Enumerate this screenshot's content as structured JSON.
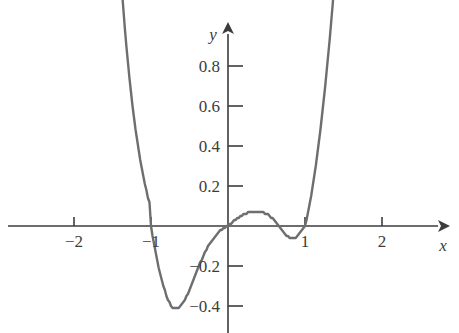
{
  "chart_data": {
    "type": "line",
    "title": "",
    "subtitle": "",
    "xlabel": "x",
    "ylabel": "y",
    "xlim": [
      -2.55,
      2.75
    ],
    "ylim": [
      -0.52,
      0.99
    ],
    "grid": false,
    "legend": null,
    "legend_position": "none",
    "x_ticks": [
      -2,
      -1,
      1,
      2
    ],
    "x_tick_labels": [
      "−2",
      "−1",
      "1",
      "2"
    ],
    "y_ticks": [
      0.8,
      0.6,
      0.4,
      0.2,
      -0.2,
      -0.4
    ],
    "y_tick_labels": [
      "0.8",
      "0.6",
      "0.4",
      "0.2",
      "−0.2",
      "−0.4"
    ],
    "series": [
      {
        "name": "curve",
        "color": "#6e6e6e",
        "line_width": 2.4,
        "roots": [
          -1,
          0,
          1
        ],
        "annotations": [
          {
            "kind": "local-minimum",
            "x": -0.68,
            "y": -0.41
          },
          {
            "kind": "root",
            "x": -1,
            "y": 0
          },
          {
            "kind": "root",
            "x": 0,
            "y": 0
          },
          {
            "kind": "local-maximum",
            "x": 0.45,
            "y": 0.07
          },
          {
            "kind": "local-minimum",
            "x": 0.85,
            "y": -0.06
          },
          {
            "kind": "root",
            "x": 1,
            "y": 0
          }
        ],
        "points": [
          [
            -1.4,
            1.3
          ],
          [
            -1.38,
            1.19
          ],
          [
            -1.36,
            1.09
          ],
          [
            -1.34,
            0.99
          ],
          [
            -1.32,
            0.9
          ],
          [
            -1.3,
            0.82
          ],
          [
            -1.28,
            0.74
          ],
          [
            -1.26,
            0.67
          ],
          [
            -1.24,
            0.6
          ],
          [
            -1.22,
            0.54
          ],
          [
            -1.2,
            0.48
          ],
          [
            -1.18,
            0.43
          ],
          [
            -1.16,
            0.38
          ],
          [
            -1.14,
            0.33
          ],
          [
            -1.12,
            0.29
          ],
          [
            -1.1,
            0.25
          ],
          [
            -1.08,
            0.21
          ],
          [
            -1.06,
            0.18
          ],
          [
            -1.04,
            0.14
          ],
          [
            -1.02,
            0.12
          ],
          [
            -1.0,
            0.0
          ],
          [
            -0.98,
            -0.05
          ],
          [
            -0.96,
            -0.09
          ],
          [
            -0.94,
            -0.13
          ],
          [
            -0.92,
            -0.17
          ],
          [
            -0.9,
            -0.21
          ],
          [
            -0.88,
            -0.24
          ],
          [
            -0.86,
            -0.27
          ],
          [
            -0.84,
            -0.3
          ],
          [
            -0.82,
            -0.32
          ],
          [
            -0.8,
            -0.35
          ],
          [
            -0.78,
            -0.37
          ],
          [
            -0.76,
            -0.38
          ],
          [
            -0.74,
            -0.4
          ],
          [
            -0.72,
            -0.41
          ],
          [
            -0.7,
            -0.41
          ],
          [
            -0.68,
            -0.41
          ],
          [
            -0.66,
            -0.41
          ],
          [
            -0.64,
            -0.41
          ],
          [
            -0.62,
            -0.4
          ],
          [
            -0.6,
            -0.39
          ],
          [
            -0.58,
            -0.38
          ],
          [
            -0.56,
            -0.37
          ],
          [
            -0.54,
            -0.35
          ],
          [
            -0.52,
            -0.34
          ],
          [
            -0.5,
            -0.32
          ],
          [
            -0.48,
            -0.3
          ],
          [
            -0.46,
            -0.28
          ],
          [
            -0.44,
            -0.26
          ],
          [
            -0.42,
            -0.24
          ],
          [
            -0.4,
            -0.22
          ],
          [
            -0.38,
            -0.2
          ],
          [
            -0.36,
            -0.18
          ],
          [
            -0.34,
            -0.17
          ],
          [
            -0.32,
            -0.15
          ],
          [
            -0.3,
            -0.13
          ],
          [
            -0.28,
            -0.12
          ],
          [
            -0.26,
            -0.1
          ],
          [
            -0.24,
            -0.09
          ],
          [
            -0.22,
            -0.08
          ],
          [
            -0.2,
            -0.07
          ],
          [
            -0.18,
            -0.06
          ],
          [
            -0.16,
            -0.05
          ],
          [
            -0.14,
            -0.04
          ],
          [
            -0.12,
            -0.03
          ],
          [
            -0.1,
            -0.02
          ],
          [
            -0.08,
            -0.02
          ],
          [
            -0.06,
            -0.01
          ],
          [
            -0.04,
            -0.01
          ],
          [
            -0.02,
            0.0
          ],
          [
            0.0,
            0.0
          ],
          [
            0.02,
            0.01
          ],
          [
            0.04,
            0.01
          ],
          [
            0.06,
            0.02
          ],
          [
            0.08,
            0.03
          ],
          [
            0.1,
            0.03
          ],
          [
            0.12,
            0.04
          ],
          [
            0.14,
            0.04
          ],
          [
            0.16,
            0.05
          ],
          [
            0.18,
            0.05
          ],
          [
            0.2,
            0.06
          ],
          [
            0.22,
            0.06
          ],
          [
            0.24,
            0.06
          ],
          [
            0.26,
            0.07
          ],
          [
            0.28,
            0.07
          ],
          [
            0.3,
            0.07
          ],
          [
            0.32,
            0.07
          ],
          [
            0.34,
            0.07
          ],
          [
            0.36,
            0.07
          ],
          [
            0.38,
            0.07
          ],
          [
            0.4,
            0.07
          ],
          [
            0.42,
            0.07
          ],
          [
            0.44,
            0.07
          ],
          [
            0.46,
            0.07
          ],
          [
            0.48,
            0.06
          ],
          [
            0.5,
            0.06
          ],
          [
            0.52,
            0.06
          ],
          [
            0.54,
            0.05
          ],
          [
            0.56,
            0.04
          ],
          [
            0.58,
            0.04
          ],
          [
            0.6,
            0.03
          ],
          [
            0.62,
            0.02
          ],
          [
            0.64,
            0.01
          ],
          [
            0.66,
            0.0
          ],
          [
            0.68,
            -0.01
          ],
          [
            0.7,
            -0.02
          ],
          [
            0.72,
            -0.03
          ],
          [
            0.74,
            -0.04
          ],
          [
            0.76,
            -0.05
          ],
          [
            0.78,
            -0.05
          ],
          [
            0.8,
            -0.06
          ],
          [
            0.82,
            -0.06
          ],
          [
            0.84,
            -0.06
          ],
          [
            0.86,
            -0.06
          ],
          [
            0.88,
            -0.06
          ],
          [
            0.9,
            -0.05
          ],
          [
            0.92,
            -0.04
          ],
          [
            0.94,
            -0.03
          ],
          [
            0.96,
            -0.02
          ],
          [
            0.98,
            -0.01
          ],
          [
            1.0,
            0.0
          ],
          [
            1.02,
            0.03
          ],
          [
            1.04,
            0.07
          ],
          [
            1.06,
            0.11
          ],
          [
            1.08,
            0.15
          ],
          [
            1.1,
            0.2
          ],
          [
            1.12,
            0.25
          ],
          [
            1.14,
            0.3
          ],
          [
            1.16,
            0.36
          ],
          [
            1.18,
            0.42
          ],
          [
            1.2,
            0.48
          ],
          [
            1.22,
            0.55
          ],
          [
            1.24,
            0.62
          ],
          [
            1.26,
            0.69
          ],
          [
            1.28,
            0.77
          ],
          [
            1.3,
            0.85
          ],
          [
            1.32,
            0.93
          ],
          [
            1.34,
            1.02
          ],
          [
            1.36,
            1.11
          ],
          [
            1.38,
            1.21
          ],
          [
            1.4,
            1.31
          ]
        ]
      }
    ]
  },
  "axes": {
    "x_axis_name": "x-axis",
    "y_axis_name": "y-axis",
    "x_label": "x",
    "y_label": "y",
    "arrow_x": "arrow-right",
    "arrow_y": "arrow-up",
    "color": "#3c3c3c"
  },
  "ticks": {
    "x": [
      {
        "label": "−2",
        "value": -2
      },
      {
        "label": "−1",
        "value": -1
      },
      {
        "label": "1",
        "value": 1
      },
      {
        "label": "2",
        "value": 2
      }
    ],
    "y": [
      {
        "label": "0.8",
        "value": 0.8
      },
      {
        "label": "0.6",
        "value": 0.6
      },
      {
        "label": "0.4",
        "value": 0.4
      },
      {
        "label": "0.2",
        "value": 0.2
      },
      {
        "label": "−0.2",
        "value": -0.2
      },
      {
        "label": "−0.4",
        "value": -0.4
      }
    ]
  },
  "colors": {
    "background": "#ffffff",
    "curve": "#6e6e6e",
    "axis": "#3c3c3c",
    "text": "#3c3c3c"
  }
}
